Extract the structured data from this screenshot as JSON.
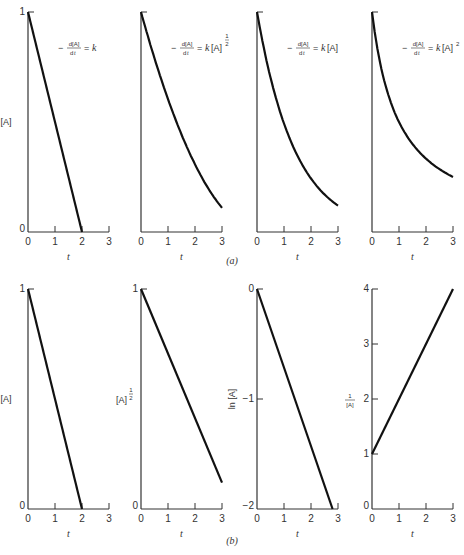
{
  "figure": {
    "row_labels": [
      "(a)",
      "(b)"
    ]
  },
  "chart_data": [
    {
      "type": "line",
      "row": "a",
      "panel": 1,
      "title": "-d[A]/dt = k",
      "xlabel": "t",
      "ylabel": "[A]",
      "xlim": [
        0,
        3
      ],
      "ylim": [
        0,
        1
      ],
      "xticks": [
        "0",
        "1",
        "2",
        "3"
      ],
      "yticks": [
        "0",
        "1"
      ],
      "x": [
        0,
        2
      ],
      "values": [
        1,
        0
      ]
    },
    {
      "type": "line",
      "row": "a",
      "panel": 2,
      "title": "-d[A]/dt = k[A]^1/2",
      "xlabel": "t",
      "ylabel": "",
      "xlim": [
        0,
        3
      ],
      "ylim": [
        0,
        1
      ],
      "xticks": [
        "0",
        "1",
        "2",
        "3"
      ],
      "yticks": [],
      "x": [
        0,
        0.5,
        1,
        1.5,
        2,
        2.5,
        3
      ],
      "values": [
        1,
        0.79,
        0.6,
        0.44,
        0.3,
        0.19,
        0.11
      ]
    },
    {
      "type": "line",
      "row": "a",
      "panel": 3,
      "title": "-d[A]/dt = k[A]",
      "xlabel": "t",
      "ylabel": "",
      "xlim": [
        0,
        3
      ],
      "ylim": [
        0,
        1
      ],
      "xticks": [
        "0",
        "1",
        "2",
        "3"
      ],
      "yticks": [],
      "x": [
        0,
        0.5,
        1,
        1.5,
        2,
        2.5,
        3
      ],
      "values": [
        1,
        0.7,
        0.49,
        0.35,
        0.24,
        0.17,
        0.12
      ]
    },
    {
      "type": "line",
      "row": "a",
      "panel": 4,
      "title": "-d[A]/dt = k[A]^2",
      "xlabel": "t",
      "ylabel": "",
      "xlim": [
        0,
        3
      ],
      "ylim": [
        0,
        1
      ],
      "xticks": [
        "0",
        "1",
        "2",
        "3"
      ],
      "yticks": [],
      "x": [
        0,
        0.5,
        1,
        1.5,
        2,
        2.5,
        3
      ],
      "values": [
        1,
        0.67,
        0.5,
        0.4,
        0.33,
        0.29,
        0.25
      ]
    },
    {
      "type": "line",
      "row": "b",
      "panel": 1,
      "xlabel": "t",
      "ylabel": "[A]",
      "xlim": [
        0,
        3
      ],
      "ylim": [
        0,
        1
      ],
      "xticks": [
        "0",
        "1",
        "2",
        "3"
      ],
      "yticks": [
        "0",
        "1"
      ],
      "x": [
        0,
        2
      ],
      "values": [
        1,
        0
      ]
    },
    {
      "type": "line",
      "row": "b",
      "panel": 2,
      "xlabel": "t",
      "ylabel": "[A]^1/2",
      "xlim": [
        0,
        3
      ],
      "ylim": [
        0,
        1
      ],
      "xticks": [
        "0",
        "1",
        "2",
        "3"
      ],
      "yticks": [
        "0",
        "1"
      ],
      "x": [
        0,
        3
      ],
      "values": [
        1,
        0.12
      ]
    },
    {
      "type": "line",
      "row": "b",
      "panel": 3,
      "xlabel": "t",
      "ylabel": "ln [A]",
      "xlim": [
        0,
        3
      ],
      "ylim": [
        -2,
        0
      ],
      "xticks": [
        "0",
        "1",
        "2",
        "3"
      ],
      "yticks": [
        "-2",
        "-1",
        "0"
      ],
      "x": [
        0,
        2.8
      ],
      "values": [
        0,
        -2
      ]
    },
    {
      "type": "line",
      "row": "b",
      "panel": 4,
      "xlabel": "t",
      "ylabel": "1/[A]",
      "xlim": [
        0,
        3
      ],
      "ylim": [
        0,
        4
      ],
      "xticks": [
        "0",
        "1",
        "2",
        "3"
      ],
      "yticks": [
        "0",
        "1",
        "2",
        "3",
        "4"
      ],
      "x": [
        0,
        3
      ],
      "values": [
        1,
        4
      ]
    }
  ]
}
